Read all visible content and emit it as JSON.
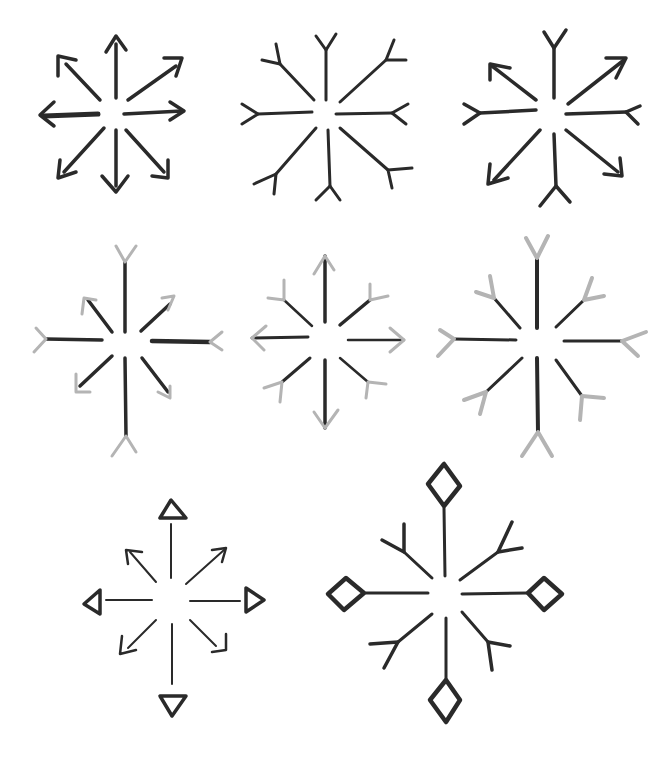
{
  "page": {
    "background": "#ffffff",
    "ink_color": "#2a2a2a",
    "guide_color": "#b4b4b4"
  },
  "snowflakes": [
    {
      "id": 1,
      "row": 1,
      "col": 1,
      "center": [
        114,
        112
      ],
      "arms": 8,
      "tip_style": "arrow",
      "ink": "dark"
    },
    {
      "id": 2,
      "row": 1,
      "col": 2,
      "center": [
        328,
        112
      ],
      "arms": 8,
      "tip_style": "fork",
      "ink": "dark"
    },
    {
      "id": 3,
      "row": 1,
      "col": 3,
      "center": [
        552,
        113
      ],
      "arms": 8,
      "tip_style": "alternating arrow/fork",
      "ink": "dark"
    },
    {
      "id": 4,
      "row": 2,
      "col": 1,
      "center": [
        125,
        340
      ],
      "arms": 8,
      "tip_style": "fork (main) / arrow (diagonal)",
      "ink": "dark with light tips"
    },
    {
      "id": 5,
      "row": 2,
      "col": 2,
      "center": [
        326,
        339
      ],
      "arms": 8,
      "tip_style": "arrow (main) / fork (diagonal)",
      "ink": "dark with light tips"
    },
    {
      "id": 6,
      "row": 2,
      "col": 3,
      "center": [
        538,
        340
      ],
      "arms": 8,
      "tip_style": "fork",
      "ink": "dark with light tips"
    },
    {
      "id": 7,
      "row": 3,
      "col": 1,
      "center": [
        172,
        601
      ],
      "arms": 8,
      "tip_style": "triangle (main) / arrow (diagonal)",
      "ink": "dark"
    },
    {
      "id": 8,
      "row": 3,
      "col": 2,
      "center": [
        444,
        593
      ],
      "arms": 8,
      "tip_style": "diamond (main) / fork (diagonal)",
      "ink": "dark"
    }
  ]
}
